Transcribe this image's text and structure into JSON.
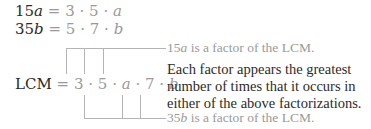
{
  "equations": [
    {
      "lhs_num": "15",
      "lhs_var": "a",
      "eq": "=",
      "factors": [
        "3",
        "5",
        "a"
      ]
    },
    {
      "lhs_num": "35",
      "lhs_var": "b",
      "eq": "=",
      "factors": [
        "5",
        "7",
        "b"
      ]
    }
  ],
  "lcm": {
    "label": "LCM",
    "eq": "=",
    "factors": [
      "3",
      "5",
      "a",
      "7",
      "b"
    ]
  },
  "annotations": {
    "top": {
      "num": "15",
      "var": "a",
      "text": " is a factor of the LCM."
    },
    "middle": "Each factor appears the greatest number of times that it occurs in either of the above factorizations.",
    "bottom": {
      "num": "35",
      "var": "b",
      "text": " is a factor of the LCM."
    }
  },
  "dot": "·",
  "colors": {
    "dark": "#2b2b2b",
    "gray": "#9a9a9a",
    "line": "#b4b4b4"
  }
}
